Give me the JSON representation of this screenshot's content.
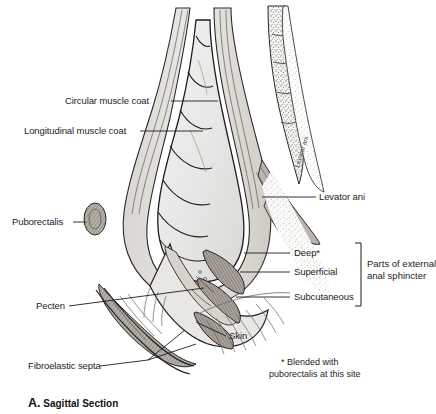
{
  "figure": {
    "caption_letter": "A.",
    "caption_text": "Sagittal Section",
    "footnote_line1": "* Blended with",
    "footnote_line2": "puborectalis at this site",
    "rotated_label": "Levator ani"
  },
  "labels": {
    "circular_muscle_coat": "Circular muscle coat",
    "longitudinal_muscle_coat": "Longitudinal muscle coat",
    "puborectalis": "Puborectalis",
    "pecten": "Pecten",
    "fibroelastic_septa": "Fibroelastic septa",
    "levator_ani": "Levator ani",
    "deep": "Deep*",
    "superficial": "Superficial",
    "subcutaneous": "Subcutaneous",
    "skin": "Skin",
    "group_line1": "Parts of external",
    "group_line2": "anal sphincter"
  },
  "colors": {
    "ink": "#1d1d1d",
    "outline": "#222222",
    "muscle_fill": "#b9b4ad",
    "lumen_fill": "#ededec",
    "fat_fill": "#fbfbfb",
    "background": "#ffffff"
  }
}
